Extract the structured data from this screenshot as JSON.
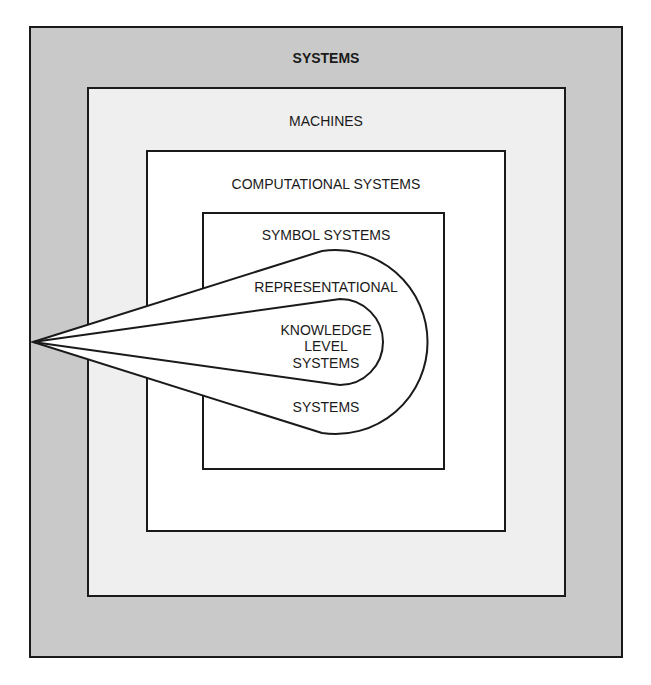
{
  "diagram": {
    "type": "nested-sets",
    "levels": [
      {
        "label": "SYSTEMS",
        "shape": "rect",
        "fill": "#c9c9c9"
      },
      {
        "label": "MACHINES",
        "shape": "rect",
        "fill": "#efefef"
      },
      {
        "label": "COMPUTATIONAL SYSTEMS",
        "shape": "rect",
        "fill": "#ffffff"
      },
      {
        "label": "SYMBOL SYSTEMS",
        "shape": "rect",
        "fill": "#ffffff"
      }
    ],
    "representational": {
      "line1": "REPRESENTATIONAL",
      "line2": "SYSTEMS",
      "shape": "teardrop"
    },
    "knowledge_level": {
      "line1": "KNOWLEDGE",
      "line2": "LEVEL",
      "line3": "SYSTEMS",
      "shape": "teardrop"
    },
    "colors": {
      "stroke": "#1a1a1a",
      "outer_fill": "#c9c9c9",
      "machines_fill": "#efefef",
      "inner_fill": "#ffffff"
    }
  }
}
